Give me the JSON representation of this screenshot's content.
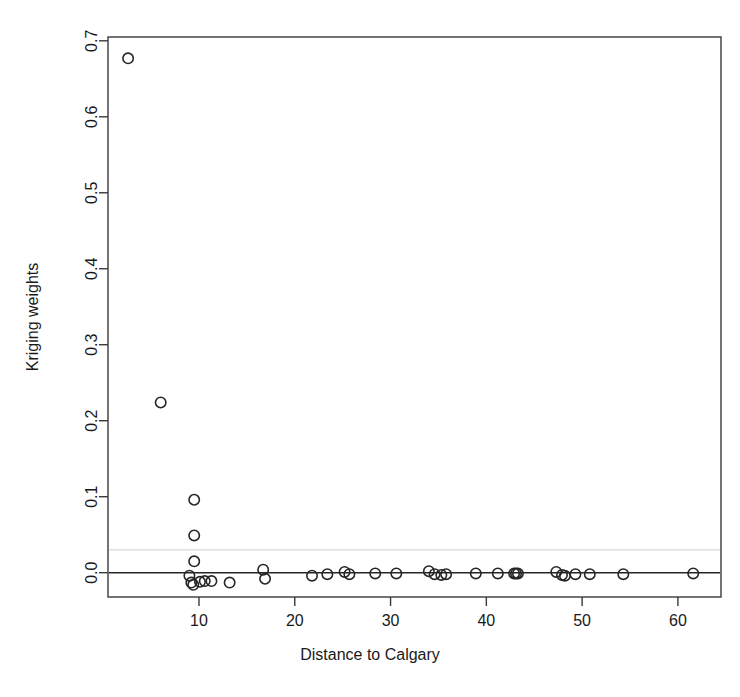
{
  "chart_data": {
    "type": "scatter",
    "title": "",
    "title_clipped_note": "Title is cropped off the top edge of the image; only glyph descenders are visible.",
    "xlabel": "Distance to Calgary",
    "ylabel": "Kriging weights",
    "xlim": [
      0.5,
      64.5
    ],
    "ylim": [
      -0.032,
      0.705
    ],
    "xticks": [
      10,
      20,
      30,
      40,
      50,
      60
    ],
    "xticklabels": [
      "10",
      "20",
      "30",
      "40",
      "50",
      "60"
    ],
    "yticks": [
      0.0,
      0.1,
      0.2,
      0.3,
      0.4,
      0.5,
      0.6,
      0.7
    ],
    "yticklabels": [
      "0.0",
      "0.1",
      "0.2",
      "0.3",
      "0.4",
      "0.5",
      "0.6",
      "0.7"
    ],
    "grid": false,
    "legend": null,
    "marker": "open-circle",
    "marker_color": "#262626",
    "reference_lines": [
      {
        "name": "zero-line",
        "orientation": "horizontal",
        "y": 0.0,
        "style": "solid",
        "color": "#262626"
      },
      {
        "name": "threshold-line",
        "orientation": "horizontal",
        "y": 0.03,
        "style": "solid-faint",
        "color": "#d8d8d8"
      }
    ],
    "x": [
      2.6,
      6.0,
      9.5,
      9.5,
      9.5,
      9.0,
      9.2,
      9.4,
      10.1,
      10.6,
      11.3,
      13.2,
      16.7,
      16.9,
      21.8,
      23.4,
      25.2,
      25.7,
      28.4,
      30.6,
      34.0,
      34.6,
      35.3,
      35.8,
      38.9,
      41.2,
      42.9,
      43.1,
      43.3,
      47.3,
      47.9,
      48.2,
      49.3,
      50.8,
      54.3,
      61.6
    ],
    "y": [
      0.677,
      0.224,
      0.096,
      0.049,
      0.015,
      -0.004,
      -0.013,
      -0.016,
      -0.012,
      -0.011,
      -0.011,
      -0.013,
      0.004,
      -0.008,
      -0.004,
      -0.002,
      0.001,
      -0.002,
      -0.001,
      -0.001,
      0.002,
      -0.002,
      -0.003,
      -0.002,
      -0.001,
      -0.001,
      -0.001,
      -0.001,
      -0.001,
      0.001,
      -0.003,
      -0.004,
      -0.002,
      -0.002,
      -0.002,
      -0.001
    ],
    "n_points": 36
  },
  "axes": {
    "y_axis_label": "Kriging weights",
    "x_axis_label": "Distance to Calgary"
  }
}
